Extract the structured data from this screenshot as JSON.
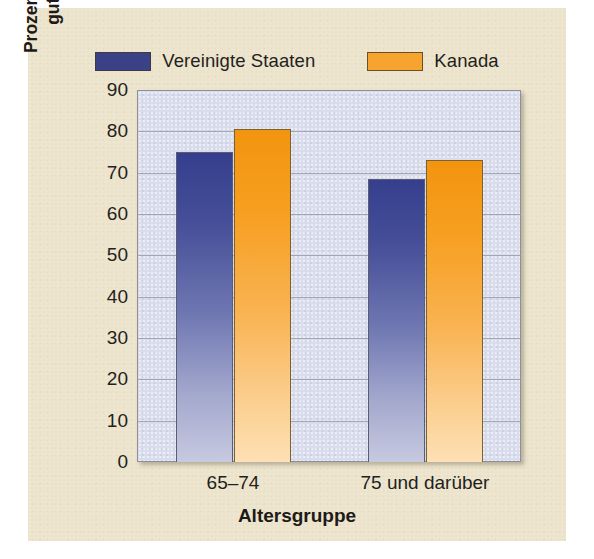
{
  "chart_data": {
    "type": "bar",
    "title": "",
    "categories": [
      "65–74",
      "75 und darüber"
    ],
    "series": [
      {
        "name": "Vereinigte Staaten",
        "color": "#3a4186",
        "values": [
          75,
          68.5
        ]
      },
      {
        "name": "Kanada",
        "color": "#f7a330",
        "values": [
          80.5,
          73
        ]
      }
    ],
    "xlabel": "Altersgruppe",
    "ylabel_lines": [
      "Prozent derer, die ihre Gesundheit als",
      "gut bis hervorragend einstufen"
    ],
    "ylim": [
      0,
      90
    ],
    "yticks": [
      0,
      10,
      20,
      30,
      40,
      50,
      60,
      70,
      80,
      90
    ],
    "ytick_labels": [
      "0",
      "10",
      "20",
      "30",
      "40",
      "50",
      "60",
      "70",
      "80",
      "90"
    ],
    "grid": true,
    "legend_position": "top-center"
  },
  "colors": {
    "page_background": "#ece3cb",
    "plot_background": "#d9dcec",
    "gridline": "#9a9ba8",
    "axis_text": "#231f1c",
    "series_us": "#3a4186",
    "series_ca": "#f7a330"
  }
}
